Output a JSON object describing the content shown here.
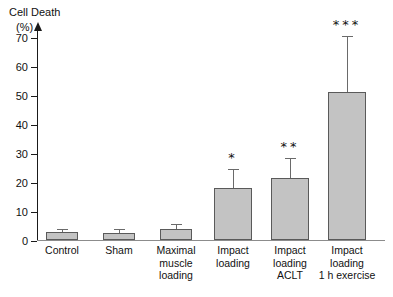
{
  "chart_data": {
    "type": "bar",
    "title": "Cell Death",
    "ylabel": "(%)",
    "xlabel": "",
    "ylim": [
      0,
      75
    ],
    "yticks": [
      0,
      10,
      20,
      30,
      40,
      50,
      60,
      70
    ],
    "grid": false,
    "legend": "none",
    "categories": [
      "Control",
      "Sham",
      "Maximal\nmuscle\nloading",
      "Impact\nloading",
      "Impact\nloading\nACLT",
      "Impact\nloading\n1 h exercise"
    ],
    "values": [
      2.7,
      2.5,
      3.7,
      18.0,
      21.2,
      51.0
    ],
    "errors_upper": [
      3.6,
      3.3,
      5.3,
      24.0,
      28.0,
      70.0
    ],
    "annotations": [
      "",
      "",
      "",
      "*",
      "**",
      "***"
    ],
    "bar_color": "#c3c3c3",
    "bar_edge_color": "#5a5a5a",
    "error_color": "#6a6a6a",
    "axis_color": "#1a1a1a"
  }
}
